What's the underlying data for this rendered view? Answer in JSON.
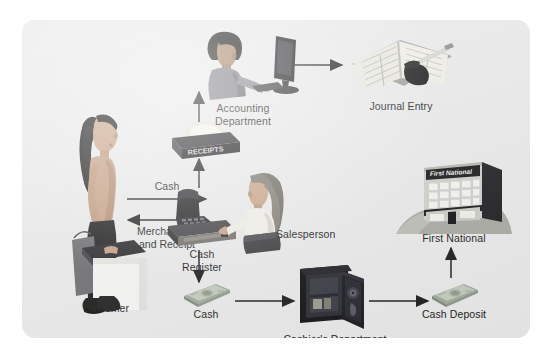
{
  "diagram": {
    "panel_color": "#e9e9e9",
    "background_color": "#ffffff",
    "ink_color": "#1b1b1b"
  },
  "nodes": {
    "customer": {
      "label": "Customer",
      "icon": "customer-figure-icon"
    },
    "cash_register": {
      "label": "Cash\nRegister",
      "icon": "cash-register-icon"
    },
    "salesperson": {
      "label": "Salesperson",
      "icon": "salesperson-figure-icon"
    },
    "receipts_tray": {
      "label": "RECEIPTS",
      "icon": "receipts-tray-icon"
    },
    "accounting": {
      "label": "Accounting\nDepartment",
      "icon": "accountant-at-computer-icon"
    },
    "journal_entry": {
      "label": "Journal Entry",
      "icon": "journal-book-icon"
    },
    "cash": {
      "label": "Cash",
      "icon": "cash-stack-icon"
    },
    "cashiers_department": {
      "label": "Cashier's Department",
      "icon": "safe-icon"
    },
    "cash_deposit": {
      "label": "Cash Deposit",
      "icon": "cash-stack-icon"
    },
    "bank": {
      "label": "First National",
      "sign_text": "First National",
      "icon": "bank-building-icon"
    }
  },
  "flows": [
    {
      "id": "customer-to-register",
      "label": "Cash",
      "direction": "right"
    },
    {
      "id": "register-to-customer",
      "label": "Merchandise\nand Receipt",
      "direction": "left"
    },
    {
      "id": "register-to-receipts",
      "label": "",
      "direction": "up"
    },
    {
      "id": "receipts-to-accounting",
      "label": "",
      "direction": "up"
    },
    {
      "id": "accounting-to-journal",
      "label": "",
      "direction": "right"
    },
    {
      "id": "register-to-cash",
      "label": "",
      "direction": "down"
    },
    {
      "id": "cash-to-safe",
      "label": "",
      "direction": "right"
    },
    {
      "id": "safe-to-deposit",
      "label": "",
      "direction": "right"
    },
    {
      "id": "deposit-to-bank",
      "label": "",
      "direction": "up"
    }
  ]
}
